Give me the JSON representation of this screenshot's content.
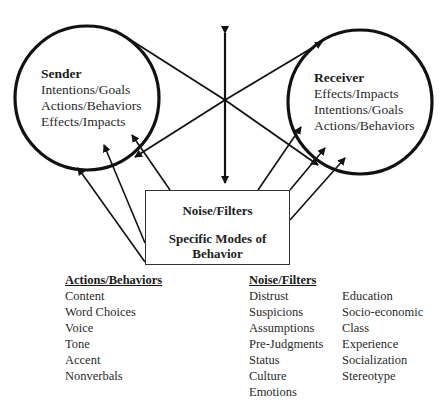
{
  "sender": {
    "title": "Sender",
    "lines": [
      "Intentions/Goals",
      "Actions/Behaviors",
      "Effects/Impacts"
    ]
  },
  "receiver": {
    "title": "Receiver",
    "lines": [
      "Effects/Impacts",
      "Intentions/Goals",
      "Actions/Behaviors"
    ]
  },
  "center_box": {
    "line1": "Noise/Filters",
    "line2": "Specific Modes of Behavior"
  },
  "actions_behaviors": {
    "header": "Actions/Behaviors",
    "items": [
      "Content",
      "Word Choices",
      "Voice",
      "Tone",
      "Accent",
      "Nonverbals"
    ]
  },
  "noise_filters": {
    "header": "Noise/Filters",
    "col1": [
      "Distrust",
      "Suspicions",
      "Assumptions",
      "Pre-Judgments",
      "Status",
      "Culture",
      "Emotions"
    ],
    "col2": [
      "Education",
      "Socio-economic",
      "Class",
      "Experience",
      "Socialization",
      "Stereotype"
    ]
  }
}
